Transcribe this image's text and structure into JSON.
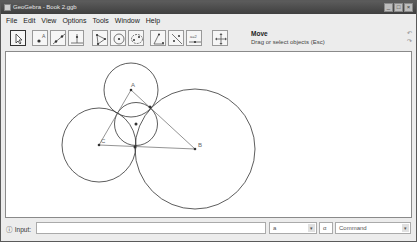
{
  "window": {
    "title": "GeoGebra - Book 2.ggb",
    "buttons": [
      "minimize",
      "maximize",
      "close"
    ]
  },
  "menubar": {
    "items": [
      "File",
      "Edit",
      "View",
      "Options",
      "Tools",
      "Window",
      "Help"
    ]
  },
  "toolbar": {
    "tools": [
      {
        "name": "move-tool",
        "icon": "cursor-arrow-icon",
        "active": true
      },
      {
        "name": "new-point-tool",
        "icon": "point-icon"
      },
      {
        "name": "line-tool",
        "icon": "line-through-points-icon"
      },
      {
        "name": "perpendicular-line-tool",
        "icon": "perpendicular-icon"
      },
      {
        "name": "polygon-tool",
        "icon": "polygon-icon"
      },
      {
        "name": "circle-tool",
        "icon": "circle-center-point-icon"
      },
      {
        "name": "conic-tool",
        "icon": "conic-icon"
      },
      {
        "name": "angle-tool",
        "icon": "angle-icon"
      },
      {
        "name": "reflect-tool",
        "icon": "reflect-icon"
      },
      {
        "name": "slider-tool",
        "icon": "slider-icon"
      },
      {
        "name": "move-graphics-tool",
        "icon": "move-graphics-icon"
      }
    ],
    "mode_title": "Move",
    "mode_help": "Drag or select objects (Esc)",
    "undo_label": "↶",
    "redo_label": "↷"
  },
  "canvas": {
    "points": [
      {
        "label": "A",
        "x": 125,
        "y": 38
      },
      {
        "label": "B",
        "x": 189,
        "y": 97
      },
      {
        "label": "C",
        "x": 93,
        "y": 93
      },
      {
        "label": "",
        "x": 130,
        "y": 72
      }
    ],
    "tangent_points": [
      {
        "x": 144,
        "y": 55
      },
      {
        "x": 129,
        "y": 95
      }
    ],
    "circles": [
      {
        "name": "circle-a",
        "cx": 125,
        "cy": 38,
        "r": 27
      },
      {
        "name": "circle-b",
        "cx": 189,
        "cy": 97,
        "r": 60
      },
      {
        "name": "circle-c",
        "cx": 93,
        "cy": 93,
        "r": 37
      },
      {
        "name": "incircle",
        "cx": 130,
        "cy": 72,
        "r": 21.5
      }
    ],
    "triangle": {
      "vertices": [
        "A",
        "B",
        "C"
      ]
    }
  },
  "inputbar": {
    "label": "Input:",
    "value": "",
    "symbol_combo": "a",
    "greek_combo": "α",
    "command_combo": "Command"
  }
}
